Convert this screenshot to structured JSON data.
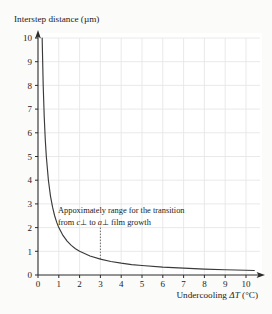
{
  "chart_data": {
    "type": "line",
    "title": "",
    "ylabel": "Interstep distance (µm)",
    "xlabel_prefix": "Undercooling ",
    "xlabel_symbol": "ΔT",
    "xlabel_suffix": " (°C)",
    "xlabel_full": "Undercooling ΔT (°C)",
    "xlim": [
      0,
      10
    ],
    "ylim": [
      0,
      10
    ],
    "xticks": [
      "0",
      "1",
      "2",
      "3",
      "4",
      "5",
      "6",
      "7",
      "8",
      "9",
      "10"
    ],
    "yticks": [
      "0",
      "1",
      "2",
      "3",
      "4",
      "5",
      "6",
      "7",
      "8",
      "9",
      "10"
    ],
    "grid": true,
    "legend": "none",
    "series": [
      {
        "name": "interstep distance vs undercooling",
        "relation": "y = 2 / x",
        "x": [
          0.2,
          0.25,
          0.3,
          0.35,
          0.4,
          0.5,
          0.6,
          0.7,
          0.8,
          0.9,
          1.0,
          1.2,
          1.4,
          1.6,
          1.8,
          2.0,
          2.5,
          3.0,
          3.5,
          4.0,
          4.5,
          5.0,
          6.0,
          7.0,
          8.0,
          9.0,
          10.0,
          10.4
        ],
        "y": [
          10.0,
          8.0,
          6.67,
          5.71,
          5.0,
          4.0,
          3.33,
          2.86,
          2.5,
          2.22,
          2.0,
          1.67,
          1.43,
          1.25,
          1.11,
          1.0,
          0.8,
          0.67,
          0.57,
          0.5,
          0.44,
          0.4,
          0.33,
          0.29,
          0.25,
          0.22,
          0.2,
          0.19
        ]
      }
    ],
    "marker_line": {
      "x": 3,
      "y_top": 2.0,
      "y_bottom": 0.67,
      "style": "dotted"
    },
    "annotation": {
      "line1": "Appoximately range for the transition",
      "line2_part1": "from ",
      "line2_c": "c",
      "line2_part2": "⊥ to ",
      "line2_a": "a",
      "line2_part3": "⊥  film growth",
      "line2_full": "from c⊥ to a⊥  film growth"
    },
    "colors": {
      "curve": "#3a3a3a",
      "axis": "#2b2b2b",
      "grid": "#e7e7e7",
      "plot_background": "#ffffff",
      "page_background": "#fbfbfa",
      "text": "#1c1c1c"
    }
  }
}
